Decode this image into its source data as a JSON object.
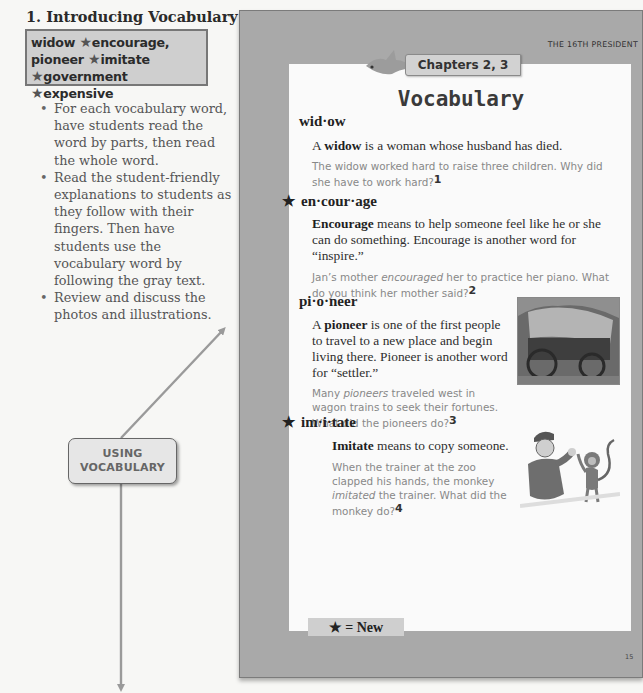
{
  "teacher_notes": {
    "section_title": "1. Introducing Vocabulary",
    "vocab_box": {
      "lines": [
        [
          {
            "word": "widow",
            "new": false
          },
          {
            "word": "encourage,",
            "new": true
          }
        ],
        [
          {
            "word": "pioneer",
            "new": false
          },
          {
            "word": "imitate",
            "new": true
          }
        ],
        [
          {
            "word": "government",
            "new": true
          },
          {
            "word": "expensive",
            "new": true
          }
        ]
      ],
      "star_glyph": "★"
    },
    "bullets": [
      "For each vocabulary word, have students read the word by parts, then read the whole word.",
      "Read the student-friendly explanations to students as they follow with their fingers. Then have students use the vocabulary word by following the gray text.",
      "Review and discuss the photos and illustrations."
    ],
    "callout_line1": "USING",
    "callout_line2": "VOCABULARY"
  },
  "student_page": {
    "running_head": "THE 16TH PRESIDENT",
    "chapter_tab": "Chapters 2, 3",
    "title": "Vocabulary",
    "entries": [
      {
        "star": "",
        "word": "wid·ow",
        "def_bold": "widow",
        "def_pre": "A ",
        "def_post": " is a woman whose husband has died.",
        "example": "The widow worked hard to raise three children. Why did she have to work hard?",
        "note": "1"
      },
      {
        "star": "★",
        "word": "en·cour·age",
        "def_bold": "Encourage",
        "def_pre": "",
        "def_post": " means to help someone feel like he or she can do something.  Encourage is another word for “inspire.”",
        "example_pre": "Jan’s mother ",
        "example_italic": "encouraged",
        "example_post": " her to practice her piano. What do you think her mother said?",
        "note": "2"
      },
      {
        "star": "",
        "word": "pi·o·neer",
        "def_bold": "pioneer",
        "def_pre": "A ",
        "def_post": " is one of the first people to travel to a new place and begin living there.  Pioneer is another word for “settler.”",
        "example_pre": "Many ",
        "example_italic": "pioneers",
        "example_post": " traveled west in wagon trains to seek their fortunes. What did the pioneers do?",
        "note": "3"
      },
      {
        "star": "★",
        "word": "im·i·tate",
        "def_bold": "Imitate",
        "def_pre": "",
        "def_post": " means to copy someone.",
        "example_pre": "When the trainer at the zoo clapped his hands, the monkey ",
        "example_italic": "imitated",
        "example_post": " the trainer.  What did the monkey do?",
        "note": "4"
      }
    ],
    "legend": "★ = New",
    "page_number": "15",
    "images": {
      "wagon": "covered-wagon-photo",
      "monkey": "trainer-and-monkey-illustration"
    }
  },
  "colors": {
    "page_frame": "#a9a9a9",
    "inner_page": "#fafafa",
    "vocab_box_fill": "#cfcfcf",
    "arrow": "#9a9a9a",
    "example_text": "#888888"
  }
}
